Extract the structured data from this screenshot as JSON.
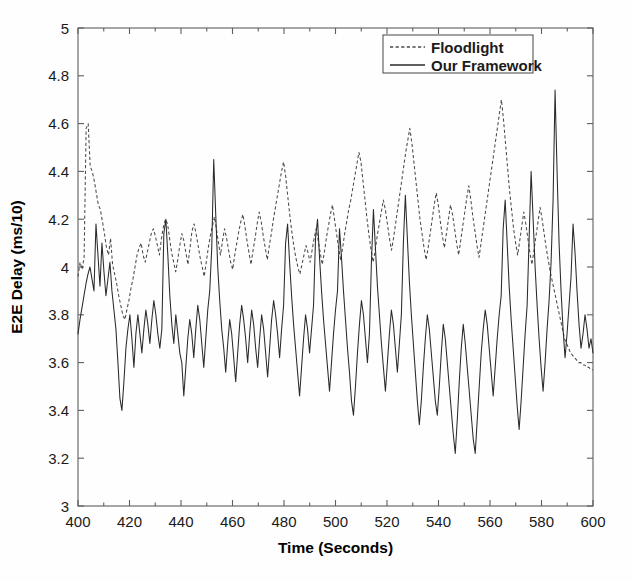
{
  "chart_data": {
    "type": "line",
    "title": "",
    "xlabel": "Time (Seconds)",
    "ylabel": "E2E Delay (ms/10)",
    "xlim": [
      400,
      600
    ],
    "ylim": [
      3,
      5
    ],
    "xticks": [
      400,
      420,
      440,
      460,
      480,
      500,
      520,
      540,
      560,
      580,
      600
    ],
    "xtick_labels": [
      "400",
      "420",
      "440",
      "460",
      "480",
      "500",
      "520",
      "540",
      "560",
      "580",
      "600"
    ],
    "yticks": [
      3,
      3.2,
      3.4,
      3.6,
      3.8,
      4,
      4.2,
      4.4,
      4.6,
      4.8,
      5
    ],
    "ytick_labels": [
      "3",
      "3.2",
      "3.4",
      "3.6",
      "3.8",
      "4",
      "4.2",
      "4.4",
      "4.6",
      "4.8",
      "5"
    ],
    "grid": false,
    "legend_position": "top-right-inside",
    "legend_entries": [
      {
        "name": "Floodlight",
        "style": "dashed",
        "color": "#4a4a4a"
      },
      {
        "name": "Our Framework",
        "style": "solid",
        "color": "#2a2a2a"
      }
    ],
    "x_step": 0.5,
    "series": [
      {
        "name": "Floodlight",
        "style": "dashed",
        "color": "#4a4a4a",
        "values": [
          3.96,
          4.02,
          3.99,
          4.04,
          4.58,
          4.6,
          4.42,
          4.4,
          4.36,
          4.31,
          4.26,
          4.24,
          4.19,
          4.14,
          4.08,
          4.05,
          4.12,
          4.01,
          3.97,
          3.93,
          3.88,
          3.84,
          3.8,
          3.78,
          3.82,
          3.86,
          3.91,
          3.95,
          4.0,
          4.05,
          4.08,
          4.1,
          4.05,
          4.02,
          4.06,
          4.1,
          4.14,
          4.16,
          4.13,
          4.09,
          4.05,
          4.12,
          4.17,
          4.2,
          4.18,
          4.12,
          4.06,
          4.02,
          3.98,
          4.03,
          4.09,
          4.14,
          4.11,
          4.06,
          4.01,
          4.08,
          4.15,
          4.18,
          4.14,
          4.09,
          4.04,
          4.0,
          3.96,
          4.02,
          4.08,
          4.13,
          4.17,
          4.21,
          4.16,
          4.1,
          4.05,
          4.11,
          4.16,
          4.12,
          4.07,
          4.02,
          3.99,
          4.05,
          4.1,
          4.15,
          4.19,
          4.22,
          4.17,
          4.11,
          4.06,
          4.01,
          4.07,
          4.12,
          4.18,
          4.23,
          4.19,
          4.13,
          4.08,
          4.03,
          4.09,
          4.14,
          4.2,
          4.25,
          4.3,
          4.35,
          4.4,
          4.44,
          4.38,
          4.3,
          4.22,
          4.15,
          4.09,
          4.04,
          4.0,
          3.97,
          4.01,
          4.05,
          4.09,
          4.06,
          4.02,
          4.07,
          4.12,
          4.16,
          4.11,
          4.06,
          4.01,
          4.06,
          4.12,
          4.17,
          4.22,
          4.26,
          4.2,
          4.14,
          4.08,
          4.03,
          4.08,
          4.14,
          4.19,
          4.24,
          4.28,
          4.33,
          4.38,
          4.43,
          4.48,
          4.44,
          4.36,
          4.28,
          4.2,
          4.13,
          4.07,
          4.02,
          4.07,
          4.13,
          4.18,
          4.23,
          4.28,
          4.24,
          4.18,
          4.12,
          4.07,
          4.12,
          4.18,
          4.24,
          4.3,
          4.36,
          4.42,
          4.48,
          4.53,
          4.58,
          4.52,
          4.44,
          4.36,
          4.28,
          4.2,
          4.14,
          4.08,
          4.03,
          4.08,
          4.14,
          4.2,
          4.26,
          4.31,
          4.26,
          4.19,
          4.13,
          4.08,
          4.14,
          4.2,
          4.26,
          4.22,
          4.16,
          4.1,
          4.05,
          4.11,
          4.17,
          4.23,
          4.29,
          4.34,
          4.28,
          4.21,
          4.15,
          4.09,
          4.04,
          4.1,
          4.16,
          4.22,
          4.28,
          4.34,
          4.4,
          4.46,
          4.52,
          4.58,
          4.64,
          4.7,
          4.62,
          4.52,
          4.42,
          4.32,
          4.24,
          4.16,
          4.1,
          4.05,
          4.11,
          4.17,
          4.23,
          4.18,
          4.12,
          4.06,
          4.01,
          4.07,
          4.13,
          4.19,
          4.25,
          4.2,
          4.14,
          4.08,
          4.03,
          3.98,
          3.94,
          3.9,
          3.86,
          3.82,
          3.78,
          3.74,
          3.7,
          3.68,
          3.66,
          3.64,
          3.63,
          3.62,
          3.61,
          3.6,
          3.6,
          3.59,
          3.59,
          3.58,
          3.58,
          3.57,
          3.57
        ]
      },
      {
        "name": "Our Framework",
        "style": "solid",
        "color": "#2a2a2a",
        "values": [
          3.72,
          3.78,
          3.83,
          3.88,
          3.93,
          3.97,
          4.0,
          3.95,
          3.9,
          4.18,
          4.05,
          3.92,
          4.1,
          3.98,
          3.88,
          3.95,
          4.02,
          3.9,
          3.82,
          3.74,
          3.6,
          3.45,
          3.4,
          3.52,
          3.66,
          3.74,
          3.8,
          3.7,
          3.58,
          3.72,
          3.8,
          3.72,
          3.64,
          3.74,
          3.82,
          3.76,
          3.68,
          3.78,
          3.86,
          3.8,
          3.72,
          3.66,
          3.74,
          4.14,
          4.2,
          4.05,
          3.88,
          3.76,
          3.68,
          3.8,
          3.72,
          3.64,
          3.6,
          3.46,
          3.58,
          3.7,
          3.78,
          3.72,
          3.62,
          3.74,
          3.84,
          3.78,
          3.68,
          3.58,
          3.7,
          3.82,
          3.9,
          4.08,
          4.45,
          4.22,
          4.0,
          3.86,
          3.74,
          3.66,
          3.56,
          3.68,
          3.78,
          3.72,
          3.62,
          3.52,
          3.64,
          3.76,
          3.84,
          3.78,
          3.7,
          3.6,
          3.72,
          3.82,
          3.76,
          3.66,
          3.58,
          3.7,
          3.8,
          3.74,
          3.64,
          3.54,
          3.66,
          3.78,
          3.86,
          3.8,
          3.72,
          3.62,
          3.74,
          3.84,
          4.1,
          4.18,
          4.02,
          3.88,
          3.76,
          3.66,
          3.56,
          3.46,
          3.58,
          3.7,
          3.8,
          3.74,
          3.64,
          3.74,
          3.84,
          4.12,
          4.2,
          4.04,
          3.9,
          3.78,
          3.68,
          3.58,
          3.48,
          3.6,
          3.72,
          3.82,
          3.9,
          4.16,
          4.04,
          3.9,
          3.78,
          3.66,
          3.56,
          3.44,
          3.38,
          3.5,
          3.64,
          3.76,
          3.86,
          3.8,
          3.7,
          3.6,
          3.72,
          4.02,
          4.24,
          4.08,
          3.92,
          3.8,
          3.68,
          3.58,
          3.48,
          3.6,
          3.72,
          3.82,
          3.76,
          3.66,
          3.56,
          3.68,
          3.8,
          4.1,
          4.3,
          4.12,
          3.94,
          3.8,
          3.68,
          3.56,
          3.44,
          3.34,
          3.44,
          3.58,
          3.7,
          3.8,
          3.74,
          3.64,
          3.54,
          3.44,
          3.38,
          3.5,
          3.64,
          3.76,
          3.7,
          3.6,
          3.5,
          3.4,
          3.3,
          3.22,
          3.36,
          3.52,
          3.66,
          3.76,
          3.68,
          3.58,
          3.48,
          3.38,
          3.28,
          3.22,
          3.36,
          3.5,
          3.64,
          3.74,
          3.82,
          3.76,
          3.66,
          3.56,
          3.46,
          3.58,
          3.7,
          3.8,
          3.88,
          4.16,
          4.28,
          4.1,
          3.92,
          3.78,
          3.66,
          3.54,
          3.42,
          3.32,
          3.44,
          3.58,
          3.72,
          3.84,
          4.12,
          4.4,
          4.2,
          4.0,
          3.84,
          3.7,
          3.58,
          3.48,
          3.6,
          3.74,
          3.86,
          4.02,
          4.28,
          4.74,
          4.4,
          4.1,
          3.9,
          3.74,
          3.62,
          3.72,
          3.84,
          3.96,
          4.18,
          4.06,
          3.9,
          3.76,
          3.66,
          3.72,
          3.8,
          3.74,
          3.66,
          3.7,
          3.64
        ]
      }
    ]
  },
  "axes": {
    "x_axis_name": "time-axis",
    "y_axis_name": "delay-axis"
  }
}
